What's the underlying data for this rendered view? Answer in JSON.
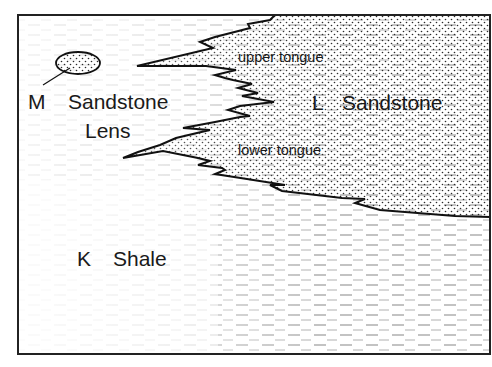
{
  "diagram": {
    "type": "geologic cross-section (facies relationships)",
    "units": {
      "K": {
        "letter": "K",
        "name": "Shale",
        "pattern": "dashed-lines"
      },
      "L": {
        "letter": "L",
        "name": "Sandstone",
        "pattern": "stipple-dots"
      },
      "M": {
        "letter": "M",
        "name_line1": "Sandstone",
        "name_line2": "Lens",
        "pattern": "stipple-dots"
      }
    },
    "tongues": {
      "upper": "upper tongue",
      "lower": "lower tongue"
    },
    "colors": {
      "line": "#111111",
      "dash": "#8a8a8a",
      "dot": "#2a2a2a",
      "background": "#ffffff"
    }
  }
}
